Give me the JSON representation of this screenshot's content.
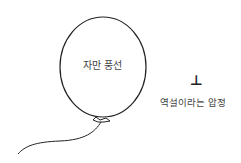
{
  "diagram": {
    "balloon": {
      "label": "자만 풍선",
      "stroke_color": "#222222"
    },
    "thumbtack": {
      "symbol": "⊥",
      "label": "역설이라는 압정"
    }
  }
}
